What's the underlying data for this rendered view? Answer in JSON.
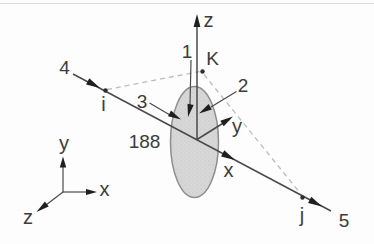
{
  "figure": {
    "element_label": "188",
    "nodes": {
      "i": "i",
      "j": "j",
      "k": "K"
    },
    "numbers": {
      "n1": "1",
      "n2": "2",
      "n3": "3",
      "n4": "4",
      "n5": "5"
    },
    "element_axes": {
      "x": "x",
      "y": "y",
      "z": "z"
    },
    "global_axes": {
      "x": "x",
      "y": "y",
      "z": "z"
    },
    "colors": {
      "line": "#4a4a4a",
      "dashed_line": "#bcbcbc",
      "arrowhead": "#1f1f1f",
      "section_fill": "#d7d7d7",
      "section_outline": "#8e8e8e",
      "text": "#3c3c3c",
      "background": "#fdfdfd"
    }
  }
}
